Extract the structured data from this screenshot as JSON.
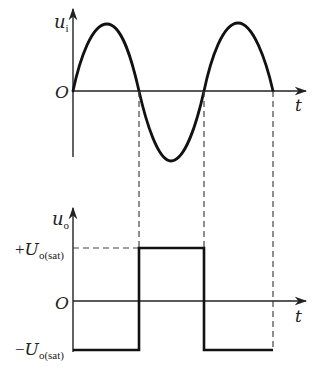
{
  "top_plot": {
    "y_label": "u",
    "y_label_sub": "i",
    "origin_label": "O",
    "x_label": "t",
    "signal": "sine",
    "zero_crossings_px": [
      73,
      139,
      204,
      273
    ]
  },
  "bottom_plot": {
    "y_label": "u",
    "y_label_sub": "o",
    "origin_label": "O",
    "x_label": "t",
    "pos_level_sign": "+",
    "pos_level_label": "U",
    "pos_level_sub": "o(sat)",
    "neg_level_sign": "−",
    "neg_level_label": "U",
    "neg_level_sub": "o(sat)",
    "signal": "square"
  },
  "colors": {
    "stroke": "#111111",
    "axis": "#222222",
    "dash": "#444444"
  }
}
